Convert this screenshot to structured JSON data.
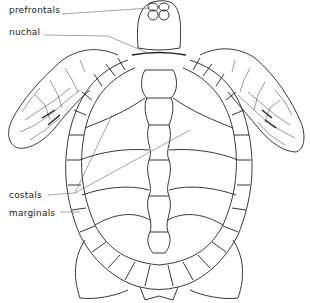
{
  "diagram": {
    "labels": [
      {
        "id": "prefrontals",
        "text": "prefrontals",
        "x": 9,
        "y": 5
      },
      {
        "id": "nuchal",
        "text": "nuchal",
        "x": 9,
        "y": 27
      },
      {
        "id": "costals",
        "text": "costals",
        "x": 9,
        "y": 190
      },
      {
        "id": "marginals",
        "text": "marginals",
        "x": 9,
        "y": 208
      }
    ],
    "colors": {
      "line": "#222222",
      "leader": "#666666",
      "background": "#ffffff"
    }
  }
}
